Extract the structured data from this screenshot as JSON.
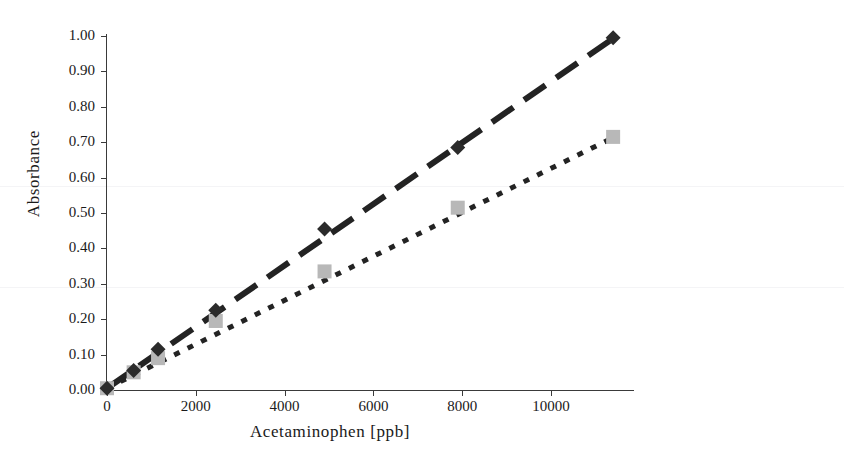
{
  "figure": {
    "top_cropped_caption": "Figure 3. Calibration curves",
    "background_color": "#ffffff"
  },
  "axes": {
    "y_title": "Absorbance",
    "x_title": "Acetaminophen [ppb]",
    "y_ticks": [
      "0.00",
      "0.10",
      "0.20",
      "0.30",
      "0.40",
      "0.50",
      "0.60",
      "0.70",
      "0.80",
      "0.90",
      "1.00"
    ],
    "x_ticks": [
      "0",
      "2000",
      "4000",
      "6000",
      "8000",
      "10000"
    ],
    "axis_color": "#3a3a3a"
  },
  "chart_data": {
    "type": "scatter",
    "title": "",
    "xlabel": "Acetaminophen [ppb]",
    "ylabel": "Absorbance",
    "xlim": [
      0,
      11870
    ],
    "ylim": [
      0.0,
      1.0
    ],
    "grid": false,
    "legend": "none",
    "series": [
      {
        "name": "Series 1 (upper, dark diamonds, long-dash fit)",
        "marker": "diamond",
        "color": "#2b2b2b",
        "line_style": "long-dash",
        "x": [
          0,
          600,
          1150,
          2450,
          4900,
          7900,
          11400
        ],
        "y": [
          0.005,
          0.055,
          0.115,
          0.225,
          0.455,
          0.685,
          0.995
        ]
      },
      {
        "name": "Series 2 (lower, light gray squares, dotted fit)",
        "marker": "square",
        "color": "#b8b8b8",
        "line_style": "dotted",
        "x": [
          0,
          600,
          1150,
          2450,
          4900,
          7900,
          11400
        ],
        "y": [
          0.005,
          0.05,
          0.09,
          0.195,
          0.335,
          0.515,
          0.715
        ]
      }
    ],
    "trendlines": [
      {
        "name": "upper-fit",
        "style": "long-dash",
        "color": "#232323",
        "x0": 0,
        "y0": 0.005,
        "x1": 11480,
        "y1": 1.0
      },
      {
        "name": "lower-fit",
        "style": "dotted",
        "color": "#232323",
        "x0": 0,
        "y0": 0.005,
        "x1": 11480,
        "y1": 0.718
      }
    ]
  }
}
